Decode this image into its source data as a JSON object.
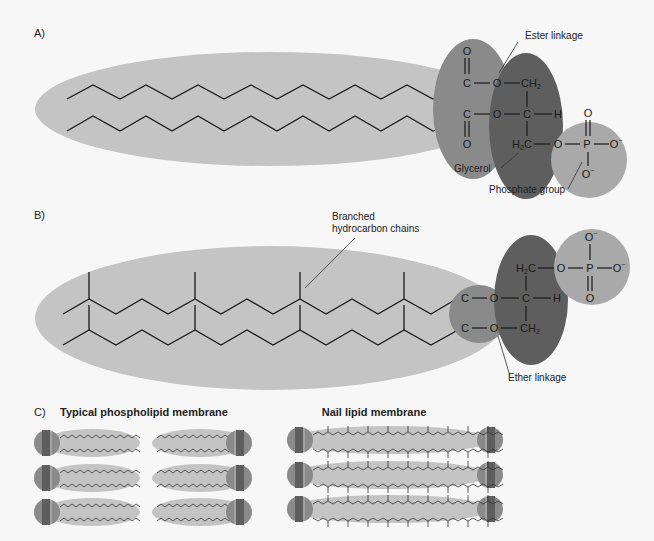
{
  "panels": {
    "a": {
      "label": "A)",
      "annotations": {
        "ester": "Ester linkage",
        "glycerol": "Glycerol",
        "phosphate": "Phosphate group"
      },
      "atoms": {
        "o_top": "O",
        "c1": "C",
        "o1": "O",
        "ch2_top": "CH",
        "ch2_top_sub": "2",
        "c2": "C",
        "o2": "O",
        "c_mid": "C",
        "h": "H",
        "o_bot": "O",
        "h2c": "H",
        "h2c_sub": "2",
        "h2c_c": "C",
        "o3": "O",
        "p": "P",
        "o_p_top": "O",
        "o_p_right": "O",
        "o_p_right_charge": "−",
        "o_p_bot": "O",
        "o_p_bot_charge": "−"
      }
    },
    "b": {
      "label": "B)",
      "annotations": {
        "branched_line1": "Branched",
        "branched_line2": "hydrocarbon chains",
        "ether": "Ether linkage"
      },
      "atoms": {
        "h2c": "H",
        "h2c_sub": "2",
        "h2c_c": "C",
        "o_top": "O",
        "p": "P",
        "o_p_top": "O",
        "o_p_top_charge": "−",
        "o_p_right": "O",
        "o_p_right_charge": "−",
        "o_p_bot": "O",
        "c1": "C",
        "o1": "O",
        "c_mid": "C",
        "h": "H",
        "c2": "C",
        "o2": "O",
        "ch2": "CH",
        "ch2_sub": "2"
      }
    },
    "c": {
      "label": "C)",
      "typical_title": "Typical phospholipid membrane",
      "nail_title": "Nail lipid membrane"
    }
  },
  "colors": {
    "background": "#f7f7f7",
    "tail_ellipse": "#c4c4c4",
    "ester_ellipse": "#8a8a8a",
    "glycerol_ellipse": "#5e5e5e",
    "phosphate_circle": "#a9a9a9",
    "ink": "#1a1a1a"
  }
}
